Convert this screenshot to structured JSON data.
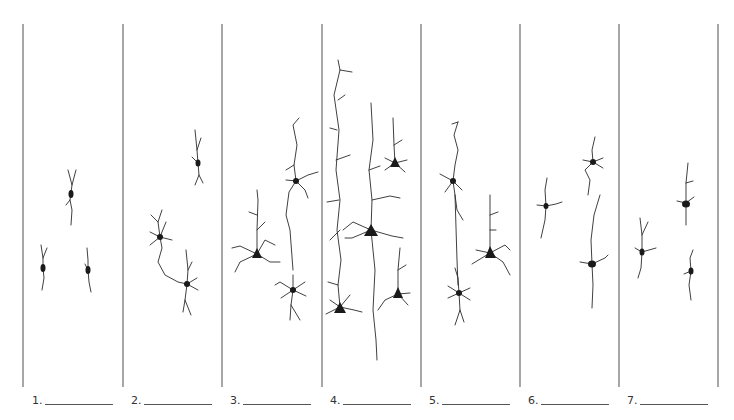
{
  "diagram": {
    "divider_color": "#777777",
    "neuron_color": "#1a1a1a",
    "panels": [
      {
        "number": "1.",
        "blank": "__________",
        "neuron_count": 3
      },
      {
        "number": "2.",
        "blank": "__________",
        "neuron_count": 3
      },
      {
        "number": "3.",
        "blank": "__________",
        "neuron_count": 3
      },
      {
        "number": "4.",
        "blank": "__________",
        "neuron_count": 4
      },
      {
        "number": "5.",
        "blank": "__________",
        "neuron_count": 3
      },
      {
        "number": "6.",
        "blank": "__________",
        "neuron_count": 3
      },
      {
        "number": "7.",
        "blank": "__________",
        "neuron_count": 3
      }
    ]
  }
}
